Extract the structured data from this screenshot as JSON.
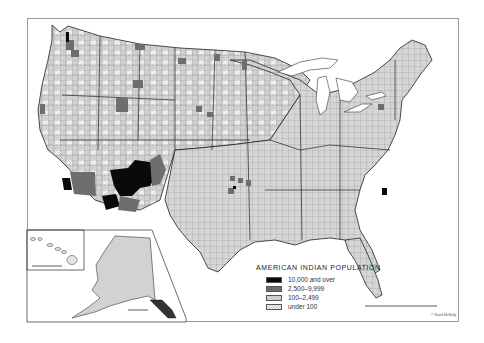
{
  "map": {
    "title": "AMERICAN INDIAN POPULATION",
    "region": "United States (conterminous) with Alaska and Hawaii insets",
    "unit": "counties",
    "colors": {
      "background": "#ffffff",
      "frame": "#9a9a9a",
      "county_border": "#555555",
      "state_border": "#222222"
    }
  },
  "legend": {
    "title": "AMERICAN INDIAN POPULATION",
    "items": [
      {
        "label": "10,000 and over",
        "color": "#0a0a0a",
        "pattern": "solid"
      },
      {
        "label": "2,500–9,999",
        "color": "#6e6e6e",
        "pattern": "solid"
      },
      {
        "label": "100–2,499",
        "color": "#cfcfcf",
        "pattern": "solid"
      },
      {
        "label": "under 100",
        "color": "#f2f2f2",
        "pattern": "hatched"
      }
    ]
  },
  "insets": [
    {
      "name": "Hawaii",
      "has_scale_bar": true
    },
    {
      "name": "Alaska",
      "has_scale_bar": true
    }
  ],
  "scale_bar": {
    "present": true
  },
  "credit": "© Rand McNally"
}
